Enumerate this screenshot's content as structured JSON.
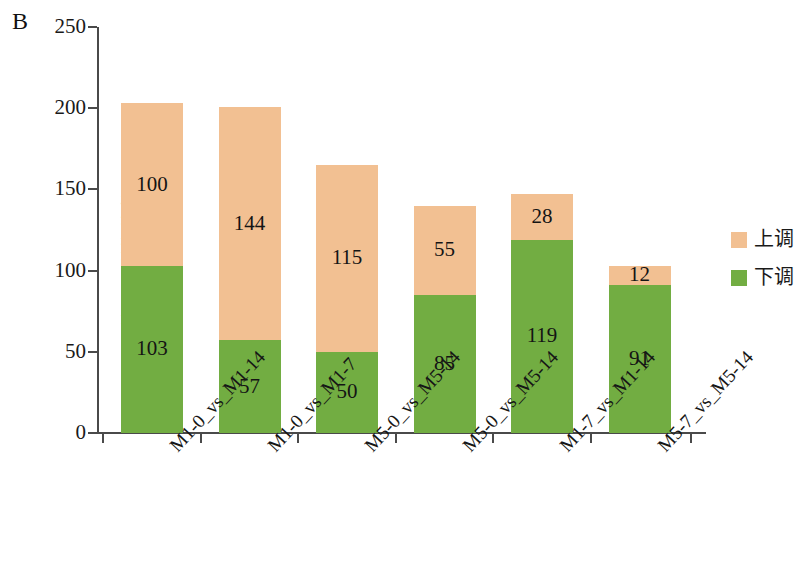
{
  "panel": {
    "label": "B"
  },
  "axes": {
    "y_title": "差异代谢物的数量",
    "y_ticks": [
      "0",
      "50",
      "100",
      "150",
      "200",
      "250"
    ],
    "y_min": 0,
    "y_max": 250
  },
  "legend": {
    "items": [
      {
        "label": "上调",
        "color": "#f2c092",
        "key": "up"
      },
      {
        "label": "下调",
        "color": "#72ad42",
        "key": "down"
      }
    ]
  },
  "chart_data": {
    "type": "bar",
    "title": "",
    "subtitle": "",
    "xlabel": "",
    "ylabel": "差异代谢物的数量",
    "ylim": [
      0,
      250
    ],
    "grid": false,
    "stacked": true,
    "legend_position": "right",
    "categories": [
      "M1-0_vs_M1-14",
      "M1-0_vs_M1-7",
      "M5-0_vs_M5-14",
      "M5-0_vs_M5-14",
      "M1-7_vs_M1-14",
      "M5-7_vs_M5-14"
    ],
    "series": [
      {
        "name": "下调",
        "color": "#72ad42",
        "values": [
          103,
          57,
          50,
          85,
          119,
          91
        ]
      },
      {
        "name": "上调",
        "color": "#f2c092",
        "values": [
          100,
          144,
          115,
          55,
          28,
          12
        ]
      }
    ],
    "totals": [
      203,
      201,
      165,
      140,
      147,
      103
    ],
    "yticks": [
      0,
      50,
      100,
      150,
      200,
      250
    ]
  }
}
